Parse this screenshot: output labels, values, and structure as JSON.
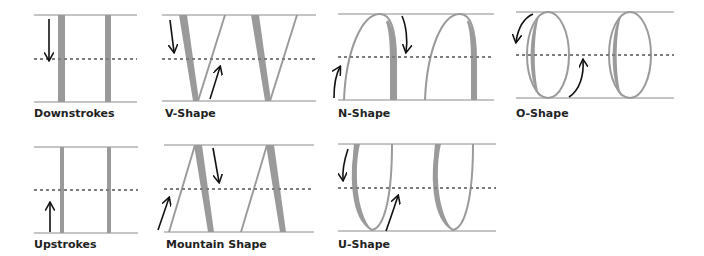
{
  "colors": {
    "guide_line": "#8a8a8a",
    "dotted_line": "#8a8a8a",
    "stroke_fill": "#9a9a9a",
    "arrow": "#111111",
    "label": "#222222"
  },
  "panels": [
    {
      "id": "downstrokes",
      "label": "Downstrokes",
      "arrow_direction": "down"
    },
    {
      "id": "v-shape",
      "label": "V-Shape",
      "arrow_direction": "down-then-up"
    },
    {
      "id": "n-shape",
      "label": "N-Shape",
      "arrow_direction": "up-then-down"
    },
    {
      "id": "o-shape",
      "label": "O-Shape",
      "arrow_direction": "counterclockwise"
    },
    {
      "id": "upstrokes",
      "label": "Upstrokes",
      "arrow_direction": "up"
    },
    {
      "id": "mountain-shape",
      "label": "Mountain Shape",
      "arrow_direction": "up-then-down"
    },
    {
      "id": "u-shape",
      "label": "U-Shape",
      "arrow_direction": "down-then-up"
    }
  ]
}
